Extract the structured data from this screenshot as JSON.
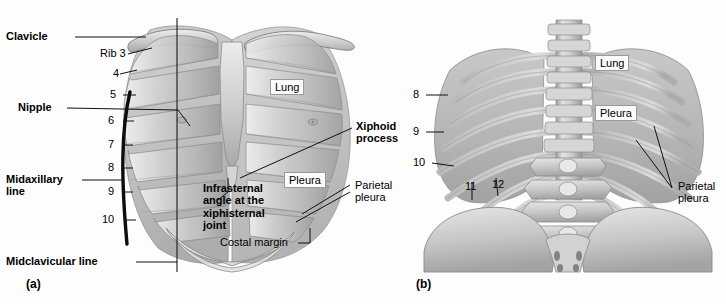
{
  "figure": {
    "panels": [
      {
        "tag": "(a)",
        "view": "anterior"
      },
      {
        "tag": "(b)",
        "view": "posterior"
      }
    ],
    "colors": {
      "bone": "#c9c9c9",
      "bone_dark": "#8f8f8f",
      "bone_light": "#e8e8e8",
      "lung": "#b9b9b9",
      "pleura": "#a8a8a8",
      "leader_line": "#111111",
      "background": "#ffffff",
      "label_box_fill": "#fbfbfb",
      "label_box_border": "#9a9a9a"
    }
  },
  "panel_a": {
    "tag": "(a)",
    "labels": {
      "clavicle": "Clavicle",
      "nipple": "Nipple",
      "midaxillary_line": "Midaxillary\nline",
      "midaxillary_line_1": "Midaxillary",
      "midaxillary_line_2": "line",
      "midclavicular_line": "Midclavicular line",
      "rib3": "Rib 3",
      "lung": "Lung",
      "pleura": "Pleura",
      "xiphoid_process_1": "Xiphoid",
      "xiphoid_process_2": "process",
      "infrasternal_1": "Infrasternal",
      "infrasternal_2": "angle at the",
      "infrasternal_3": "xiphisternal",
      "infrasternal_4": "joint",
      "parietal_pleura_1": "Parietal",
      "parietal_pleura_2": "pleura",
      "costal_margin": "Costal margin"
    },
    "rib_numbers": [
      "4",
      "5",
      "6",
      "7",
      "8",
      "9",
      "10"
    ]
  },
  "panel_b": {
    "tag": "(b)",
    "labels": {
      "lung": "Lung",
      "pleura": "Pleura",
      "parietal_pleura_1": "Parietal",
      "parietal_pleura_2": "pleura"
    },
    "rib_numbers": [
      "8",
      "9",
      "10",
      "11",
      "12"
    ]
  }
}
